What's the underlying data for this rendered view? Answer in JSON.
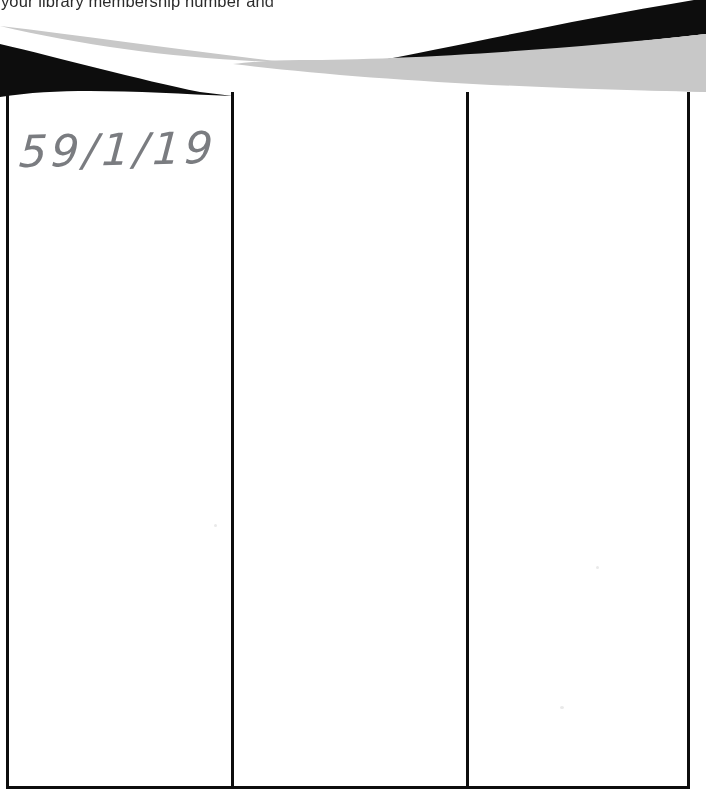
{
  "document": {
    "type": "scanned-form-fragment",
    "page_width": 706,
    "page_height": 794,
    "background_color": "#ffffff"
  },
  "cropped_text": {
    "line": "your library membership number and ",
    "note_color": "#2b2b2b"
  },
  "banner": {
    "name": "decorative-wave-graphic",
    "dark_color": "#0d0d0d",
    "light_color": "#c8c8c8",
    "height": 104
  },
  "table": {
    "column_count": 3,
    "row_count": 1,
    "border_color": "#0d0d0d",
    "columns": [
      {
        "id": "column-1",
        "header": "",
        "width": 222
      },
      {
        "id": "column-2",
        "header": "",
        "width": 232
      },
      {
        "id": "column-3",
        "header": "",
        "width": 218
      }
    ],
    "cells": [
      {
        "id": "cell-1-1",
        "value": "59/1/19",
        "handwritten": true,
        "ink_color": "#6f7176"
      },
      {
        "id": "cell-1-2",
        "value": "",
        "handwritten": false
      },
      {
        "id": "cell-1-3",
        "value": "",
        "handwritten": false
      }
    ]
  }
}
